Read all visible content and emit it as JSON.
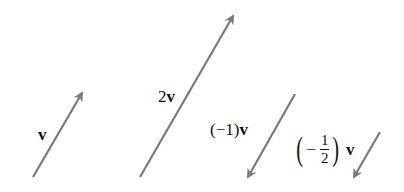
{
  "diagram": {
    "arrow_color": "#7a7a7a",
    "text_color": "#111111",
    "vectors": [
      {
        "id": "v",
        "label": "v",
        "scalar": 1,
        "tail": [
          33,
          177
        ],
        "head": [
          82,
          93
        ],
        "label_pos": [
          38,
          126
        ]
      },
      {
        "id": "2v",
        "label_coef": "2",
        "label_vec": "v",
        "scalar": 2,
        "tail": [
          140,
          177
        ],
        "head": [
          233,
          16
        ],
        "label_pos": [
          158,
          88
        ]
      },
      {
        "id": "neg1v",
        "label_coef": "(−1)",
        "label_vec": "v",
        "scalar": -1,
        "tail": [
          295,
          94
        ],
        "head": [
          248,
          177
        ],
        "label_pos": [
          210,
          121
        ]
      },
      {
        "id": "neghalfv",
        "label_open": "(",
        "label_minus": "−",
        "label_num": "1",
        "label_den": "2",
        "label_close": ")",
        "label_vec": "v",
        "scalar": -0.5,
        "tail": [
          380,
          132
        ],
        "head": [
          354,
          177
        ],
        "label_pos": [
          294,
          132
        ]
      }
    ]
  }
}
